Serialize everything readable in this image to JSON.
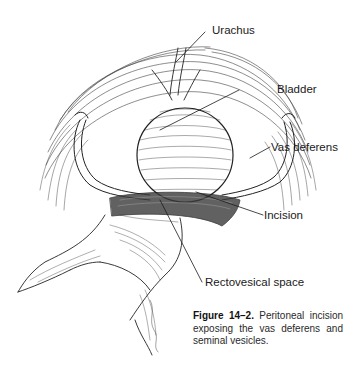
{
  "figure": {
    "labels": {
      "urachus": "Urachus",
      "bladder": "Bladder",
      "vas_deferens": "Vas deferens",
      "incision": "Incision",
      "rectovesical_space": "Rectovesical space"
    },
    "caption": {
      "figure_number": "Figure 14–2.",
      "text": " Peritoneal incision exposing the vas deferens and seminal vesicles."
    },
    "colors": {
      "ink": "#1a1a1a",
      "background": "#ffffff"
    }
  }
}
